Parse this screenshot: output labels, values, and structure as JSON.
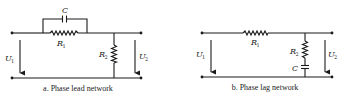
{
  "diagrams": [
    {
      "id": "a",
      "caption": "a.  Phase lead network",
      "labels": {
        "capacitor": "C",
        "r1": "R",
        "r1_sub": "1",
        "r2": "R",
        "r2_sub": "2",
        "u_in": "U",
        "u_in_sub": "1",
        "u_out": "U",
        "u_out_sub": "2"
      }
    },
    {
      "id": "b",
      "caption": "b.  Phase lag network",
      "labels": {
        "r1": "R",
        "r1_sub": "1",
        "r2": "R",
        "r2_sub": "2",
        "capacitor": "C",
        "u_in": "U",
        "u_in_sub": "1",
        "u_out": "U",
        "u_out_sub": "2"
      }
    }
  ],
  "colors": {
    "ink": "#1a1a1a",
    "background": "#ffffff"
  }
}
